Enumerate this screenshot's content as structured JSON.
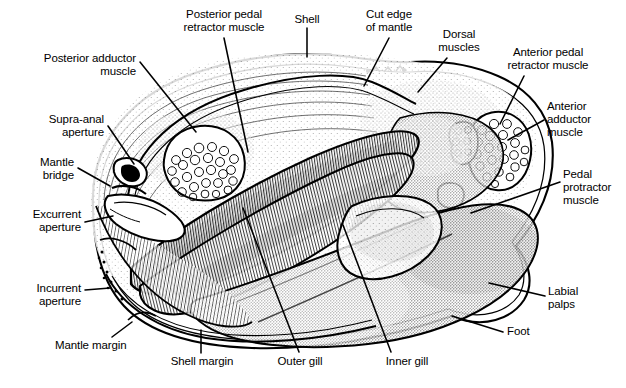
{
  "figure": {
    "type": "anatomical-line-diagram",
    "ink_color": "#000000",
    "background_color": "#ffffff",
    "label_font_size_px": 11.5
  },
  "labels": [
    {
      "id": "posterior-pedal-retractor-muscle",
      "text": "Posterior pedal\nretractor muscle",
      "align": "center",
      "x": 166,
      "y": 8,
      "width": 116,
      "leader": [
        [
          224,
          38
        ],
        [
          248,
          152
        ]
      ]
    },
    {
      "id": "shell",
      "text": "Shell",
      "align": "center",
      "x": 285,
      "y": 13,
      "width": 44,
      "leader": [
        [
          307,
          28
        ],
        [
          307,
          57
        ]
      ]
    },
    {
      "id": "cut-edge-of-mantle",
      "text": "Cut edge\nof mantle",
      "align": "center",
      "x": 355,
      "y": 8,
      "width": 68,
      "leader": [
        [
          389,
          38
        ],
        [
          364,
          86
        ]
      ]
    },
    {
      "id": "dorsal-muscles",
      "text": "Dorsal\nmuscles",
      "align": "center",
      "x": 430,
      "y": 28,
      "width": 58,
      "leader": [
        [
          447,
          58
        ],
        [
          418,
          92
        ]
      ]
    },
    {
      "id": "anterior-pedal-retractor-muscle",
      "text": "Anterior pedal\nretractor muscle",
      "align": "center",
      "x": 492,
      "y": 46,
      "width": 112,
      "leader": [
        [
          524,
          76
        ],
        [
          500,
          124
        ]
      ]
    },
    {
      "id": "posterior-adductor-muscle",
      "text": "Posterior adductor\nmuscle",
      "align": "right",
      "x": 24,
      "y": 52,
      "width": 112,
      "leader": [
        [
          140,
          62
        ],
        [
          196,
          132
        ]
      ]
    },
    {
      "id": "anterior-adductor-muscle",
      "text": "Anterior\nadductor\nmuscle",
      "align": "left",
      "x": 547,
      "y": 100,
      "width": 74,
      "leader": [
        [
          544,
          120
        ],
        [
          508,
          140
        ]
      ]
    },
    {
      "id": "supra-anal-aperture",
      "text": "Supra-anal\naperture",
      "align": "right",
      "x": 30,
      "y": 113,
      "width": 74,
      "leader": [
        [
          108,
          126
        ],
        [
          134,
          164
        ]
      ]
    },
    {
      "id": "mantle-bridge",
      "text": "Mantle\nbridge",
      "align": "right",
      "x": 18,
      "y": 156,
      "width": 56,
      "leader": [
        [
          78,
          168
        ],
        [
          110,
          186
        ]
      ]
    },
    {
      "id": "pedal-protractor-muscle",
      "text": "Pedal\nprotractor\nmuscle",
      "align": "left",
      "x": 563,
      "y": 168,
      "width": 62,
      "leader": [
        [
          560,
          182
        ],
        [
          471,
          213
        ]
      ]
    },
    {
      "id": "excurrent-aperture",
      "text": "Excurrent\naperture",
      "align": "right",
      "x": 13,
      "y": 208,
      "width": 68,
      "leader": [
        [
          85,
          222
        ],
        [
          113,
          216
        ]
      ]
    },
    {
      "id": "incurrent-aperture",
      "text": "Incurrent\naperture",
      "align": "right",
      "x": 13,
      "y": 282,
      "width": 68,
      "leader": [
        [
          85,
          290
        ],
        [
          110,
          288
        ]
      ]
    },
    {
      "id": "labial-palps",
      "text": "Labial\npalps",
      "align": "left",
      "x": 548,
      "y": 285,
      "width": 54,
      "leader": [
        [
          545,
          296
        ],
        [
          489,
          283
        ]
      ]
    },
    {
      "id": "mantle-margin",
      "text": "Mantle margin",
      "align": "left",
      "x": 55,
      "y": 339,
      "width": 86,
      "leader": [
        [
          112,
          337
        ],
        [
          132,
          322
        ]
      ]
    },
    {
      "id": "foot",
      "text": "Foot",
      "align": "left",
      "x": 507,
      "y": 325,
      "width": 34,
      "leader": [
        [
          503,
          332
        ],
        [
          452,
          316
        ]
      ]
    },
    {
      "id": "shell-margin",
      "text": "Shell margin",
      "align": "center",
      "x": 163,
      "y": 355,
      "width": 78,
      "leader": [
        [
          201,
          353
        ],
        [
          201,
          330
        ]
      ]
    },
    {
      "id": "outer-gill",
      "text": "Outer gill",
      "align": "center",
      "x": 270,
      "y": 355,
      "width": 60,
      "leader": [
        [
          299,
          352
        ],
        [
          243,
          208
        ]
      ]
    },
    {
      "id": "inner-gill",
      "text": "Inner gill",
      "align": "center",
      "x": 378,
      "y": 355,
      "width": 58,
      "leader": [
        [
          391,
          352
        ],
        [
          343,
          225
        ]
      ]
    }
  ]
}
